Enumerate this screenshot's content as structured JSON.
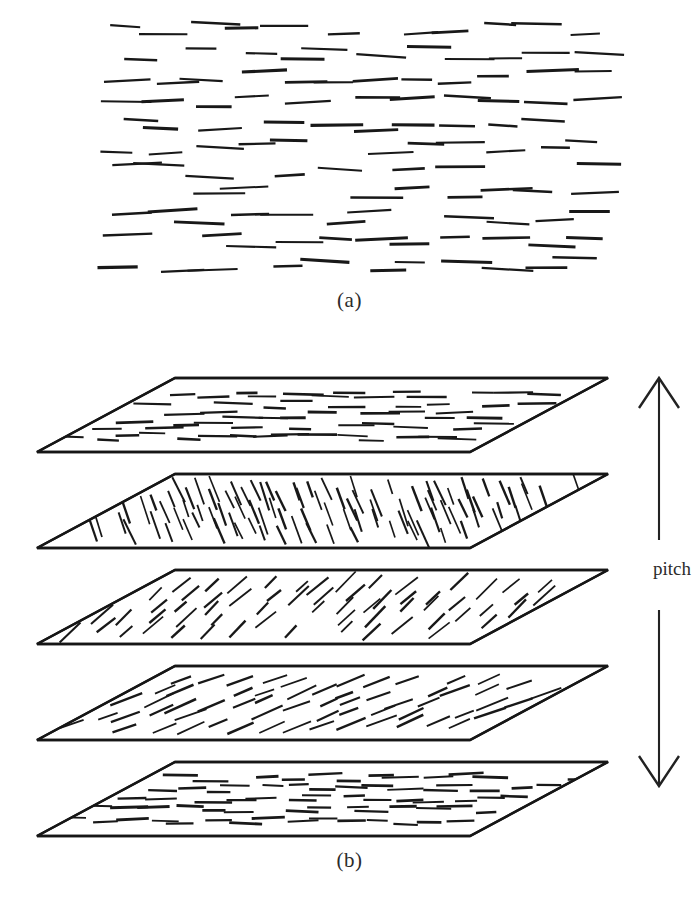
{
  "figure": {
    "background_color": "#ffffff",
    "ink_color": "#181818",
    "width": 699,
    "height": 905
  },
  "panels": [
    {
      "id": "a",
      "label": "(a)",
      "caption_position": "below",
      "description": "nematic-like layer of nearly parallel rod-shaped molecules viewed face-on",
      "region": {
        "x": 105,
        "y": 18,
        "width": 500,
        "height": 258
      },
      "rod_orientation_deg": 0,
      "rod_orientation_jitter_deg": 4,
      "rod_count": 132,
      "rod_length_px": 40,
      "rod_thickness_px": 2.4
    },
    {
      "id": "b",
      "label": "(b)",
      "caption_position": "below",
      "description": "cholesteric stack of five tilted planes; director rotates progressively through one half turn over the pitch",
      "layer_count": 5,
      "layer_spacing_px": 96
    }
  ],
  "annotations": {
    "pitch_label": "pitch",
    "pitch_arrow": {
      "type": "double-headed-vertical",
      "x": 659,
      "top_y": 378,
      "bottom_y": 786,
      "gap_top_y": 540,
      "gap_bottom_y": 610,
      "head_length_px": 30,
      "head_half_width_px": 20
    }
  },
  "chart_data": {
    "type": "diagram",
    "xlabel": "",
    "ylabel": "helix axis",
    "legend": [],
    "plane_geometry": {
      "comment": "each layer is a parallelogram drawn in oblique projection",
      "front_left_x": 37,
      "front_right_x": 470,
      "skew_x": 138,
      "depth_y": 74,
      "edge_stroke_px": 2.4
    },
    "layers": [
      {
        "index": 1,
        "name": "layer-top",
        "top_y": 378,
        "director_angle_deg": 0,
        "angle_jitter_deg": 3,
        "rod_count": 46,
        "rod_length_px": 30,
        "rod_thickness_px": 2.2
      },
      {
        "index": 2,
        "name": "layer-2",
        "top_y": 474,
        "director_angle_deg": -68,
        "angle_jitter_deg": 5,
        "rod_count": 84,
        "rod_length_px": 22,
        "rod_thickness_px": 1.9
      },
      {
        "index": 3,
        "name": "layer-3",
        "top_y": 570,
        "director_angle_deg": 42,
        "angle_jitter_deg": 5,
        "rod_count": 82,
        "rod_length_px": 22,
        "rod_thickness_px": 1.9
      },
      {
        "index": 4,
        "name": "layer-4",
        "top_y": 666,
        "director_angle_deg": 22,
        "angle_jitter_deg": 4,
        "rod_count": 60,
        "rod_length_px": 26,
        "rod_thickness_px": 2.0
      },
      {
        "index": 5,
        "name": "layer-bottom",
        "top_y": 762,
        "director_angle_deg": 0,
        "angle_jitter_deg": 3,
        "rod_count": 42,
        "rod_length_px": 28,
        "rod_thickness_px": 2.2
      }
    ]
  }
}
